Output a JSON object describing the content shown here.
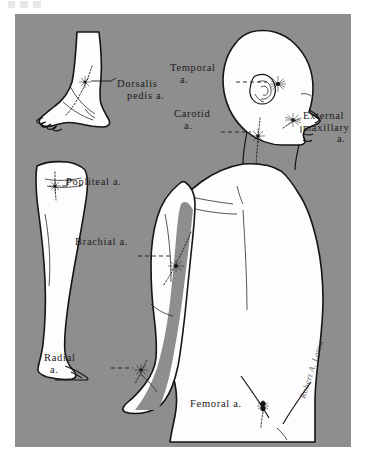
{
  "plate": {
    "title": "Arterial pressure points of the human body",
    "background_color": "#8e8e8e",
    "figure_fill": "#ffffff",
    "ink_color": "#1b1b1b",
    "artist_signature": "Robert A. Latou"
  },
  "labels": {
    "dorsalis_pedis": {
      "line1": "Dorsalis",
      "line2": "pedis a."
    },
    "temporal": {
      "line1": "Temporal",
      "line2": "a."
    },
    "carotid": {
      "line1": "Carotid",
      "line2": "a."
    },
    "external_maxillary": {
      "line1": "External",
      "line2": "maxillary",
      "line3": "a."
    },
    "popliteal": {
      "line1": "Popliteal a."
    },
    "brachial": {
      "line1": "Brachial a."
    },
    "radial": {
      "line1": "Radial",
      "line2": "a."
    },
    "femoral": {
      "line1": "Femoral a."
    }
  },
  "figures": [
    {
      "name": "foot-ankle",
      "label": "Dorsalis pedis a."
    },
    {
      "name": "lower-leg",
      "label": "Popliteal a."
    },
    {
      "name": "head-torso",
      "labels": [
        "Temporal a.",
        "Carotid a.",
        "External maxillary a.",
        "Brachial a.",
        "Radial a.",
        "Femoral a."
      ]
    }
  ],
  "pressure_points": [
    {
      "name": "dorsalis-pedis",
      "label": "Dorsalis pedis a."
    },
    {
      "name": "popliteal",
      "label": "Popliteal a."
    },
    {
      "name": "temporal",
      "label": "Temporal a."
    },
    {
      "name": "carotid",
      "label": "Carotid a."
    },
    {
      "name": "external-maxillary",
      "label": "External maxillary a."
    },
    {
      "name": "brachial",
      "label": "Brachial a."
    },
    {
      "name": "radial",
      "label": "Radial a."
    },
    {
      "name": "femoral",
      "label": "Femoral a."
    }
  ]
}
